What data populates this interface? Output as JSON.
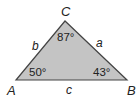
{
  "diagram": {
    "type": "triangle",
    "fill_color": "#c4c4c4",
    "stroke_color": "#444444",
    "vertices": [
      {
        "name": "A",
        "angle": "50°"
      },
      {
        "name": "B",
        "angle": "43°"
      },
      {
        "name": "C",
        "angle": "87°"
      }
    ],
    "sides": [
      {
        "name": "a"
      },
      {
        "name": "b"
      },
      {
        "name": "c"
      }
    ]
  }
}
